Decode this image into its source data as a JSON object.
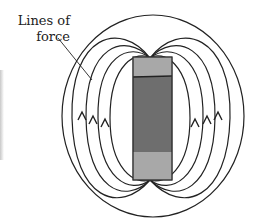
{
  "diagram": {
    "label": {
      "line1": "Lines of",
      "line2": "force"
    },
    "magnet": {
      "pole_top_color": "#a8a8a8",
      "body_color": "#6e6e6e",
      "pole_bottom_color": "#a8a8a8",
      "outline_color": "#333333"
    },
    "field_lines": {
      "stroke_color": "#222222",
      "count_per_side": 4,
      "arrows_left": 3,
      "arrows_right": 3,
      "arrow_direction": "up"
    }
  }
}
